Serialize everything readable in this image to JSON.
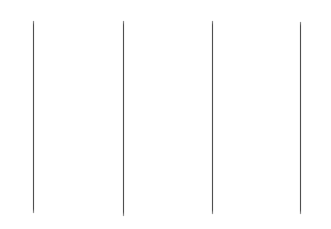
{
  "canvas": {
    "width": 331,
    "height": 229,
    "background_color": "#ffffff",
    "border": "none"
  },
  "figure": {
    "title": "",
    "subtitle": "",
    "caption": "",
    "line_color": "#4f4f4f",
    "line_edge_color": "#a0a0a0",
    "line_count": 4
  },
  "chart_data": {
    "type": "line",
    "title": "",
    "xlabel": "",
    "ylabel": "",
    "grid": false,
    "legend": null,
    "axes_visible": false,
    "tick_labels": [],
    "xlim": [
      0,
      331
    ],
    "ylim": [
      0,
      229
    ],
    "series": [
      {
        "name": "line-1",
        "x": [
          33,
          33
        ],
        "y": [
          21,
          213
        ],
        "width_px": 1,
        "color": "#4f4f4f"
      },
      {
        "name": "line-2",
        "x": [
          123,
          123
        ],
        "y": [
          21,
          216
        ],
        "width_px": 1,
        "color": "#4f4f4f"
      },
      {
        "name": "line-3",
        "x": [
          212,
          212
        ],
        "y": [
          21,
          214
        ],
        "width_px": 1,
        "color": "#4f4f4f"
      },
      {
        "name": "line-4",
        "x": [
          300,
          300
        ],
        "y": [
          22,
          214
        ],
        "width_px": 1,
        "color": "#4f4f4f"
      }
    ]
  }
}
